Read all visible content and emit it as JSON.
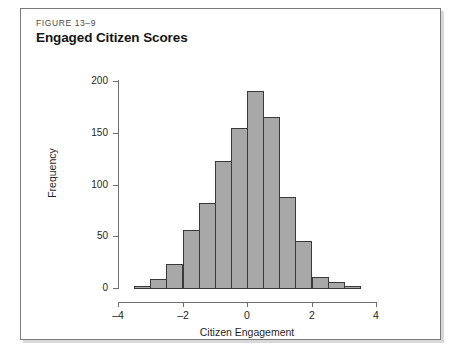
{
  "figure": {
    "number": "FIGURE 13–9",
    "title": "Engaged Citizen Scores"
  },
  "colors": {
    "bar_fill": "#a8a8a8",
    "bar_stroke": "#3a3a3a",
    "axis": "#6f6f6f",
    "frame": "#7a7a7a",
    "text": "#1f1f1f",
    "caption_gray": "#4a4a4a",
    "background": "#ffffff"
  },
  "chart_data": {
    "type": "bar",
    "title": "Engaged Citizen Scores",
    "subtitle": "FIGURE 13–9",
    "xlabel": "Citizen Engagement",
    "ylabel": "Frequency",
    "xlim": [
      -4,
      4
    ],
    "ylim": [
      0,
      200
    ],
    "grid": false,
    "legend": null,
    "bin_width": 0.5,
    "x_ticks": [
      -4,
      -2,
      0,
      2,
      4
    ],
    "x_tick_labels": [
      "–4",
      "–2",
      "0",
      "2",
      "4"
    ],
    "y_ticks": [
      0,
      50,
      100,
      150,
      200
    ],
    "y_tick_labels": [
      "0",
      "50",
      "100",
      "150",
      "200"
    ],
    "bins": [
      {
        "left": -3.5,
        "right": -3.0,
        "center": -3.25,
        "value": 2
      },
      {
        "left": -3.0,
        "right": -2.5,
        "center": -2.75,
        "value": 9
      },
      {
        "left": -2.5,
        "right": -2.0,
        "center": -2.25,
        "value": 23
      },
      {
        "left": -2.0,
        "right": -1.5,
        "center": -1.75,
        "value": 56
      },
      {
        "left": -1.5,
        "right": -1.0,
        "center": -1.25,
        "value": 82
      },
      {
        "left": -1.0,
        "right": -0.5,
        "center": -0.75,
        "value": 123
      },
      {
        "left": -0.5,
        "right": 0.0,
        "center": -0.25,
        "value": 155
      },
      {
        "left": 0.0,
        "right": 0.5,
        "center": 0.25,
        "value": 190
      },
      {
        "left": 0.5,
        "right": 1.0,
        "center": 0.75,
        "value": 165
      },
      {
        "left": 1.0,
        "right": 1.5,
        "center": 1.25,
        "value": 88
      },
      {
        "left": 1.5,
        "right": 2.0,
        "center": 1.75,
        "value": 45
      },
      {
        "left": 2.0,
        "right": 2.5,
        "center": 2.25,
        "value": 11
      },
      {
        "left": 2.5,
        "right": 3.0,
        "center": 2.75,
        "value": 6
      },
      {
        "left": 3.0,
        "right": 3.5,
        "center": 3.25,
        "value": 2
      }
    ],
    "categories": [
      -3.25,
      -2.75,
      -2.25,
      -1.75,
      -1.25,
      -0.75,
      -0.25,
      0.25,
      0.75,
      1.25,
      1.75,
      2.25,
      2.75,
      3.25
    ],
    "values": [
      2,
      9,
      23,
      56,
      82,
      123,
      155,
      190,
      165,
      88,
      45,
      11,
      6,
      2
    ]
  }
}
